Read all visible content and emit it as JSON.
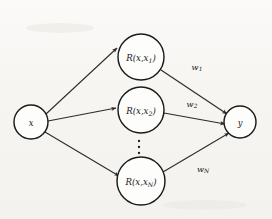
{
  "figure": {
    "type": "neural-network-diagram",
    "background_color": "#f6f5f2",
    "stroke_color": "#1b1b1b"
  },
  "nodes": {
    "input": {
      "id": "input-node",
      "label": "x",
      "label_base": "x",
      "label_sub": "",
      "cx": 31,
      "cy": 122,
      "r": 17
    },
    "hidden": [
      {
        "id": "hidden-node-1",
        "label": "R(x,x1)",
        "prefix": "R(x,x",
        "sub": "1",
        "suffix": ")",
        "cx": 141,
        "cy": 57,
        "r": 23
      },
      {
        "id": "hidden-node-2",
        "label": "R(x,x2)",
        "prefix": "R(x,x",
        "sub": "2",
        "suffix": ")",
        "cx": 141,
        "cy": 110,
        "r": 23
      },
      {
        "id": "hidden-node-N",
        "label": "R(x,xN)",
        "prefix": "R(x,x",
        "sub": "N",
        "suffix": ")",
        "cx": 141,
        "cy": 181,
        "r": 24
      }
    ],
    "output": {
      "id": "output-node",
      "label": "y",
      "label_base": "y",
      "cx": 240,
      "cy": 122,
      "r": 16
    }
  },
  "weights": [
    {
      "id": "weight-1",
      "base": "w",
      "sub": "1",
      "label": "w1",
      "x": 197,
      "y": 67
    },
    {
      "id": "weight-2",
      "base": "w",
      "sub": "2",
      "label": "w2",
      "x": 192,
      "y": 104
    },
    {
      "id": "weight-N",
      "base": "w",
      "sub": "N",
      "label": "wN",
      "x": 203,
      "y": 169
    }
  ],
  "ellipsis": {
    "id": "vertical-ellipsis",
    "symbol": "vertical-dots",
    "count": 3,
    "x": 139,
    "y_start": 141,
    "y_step": 6
  }
}
